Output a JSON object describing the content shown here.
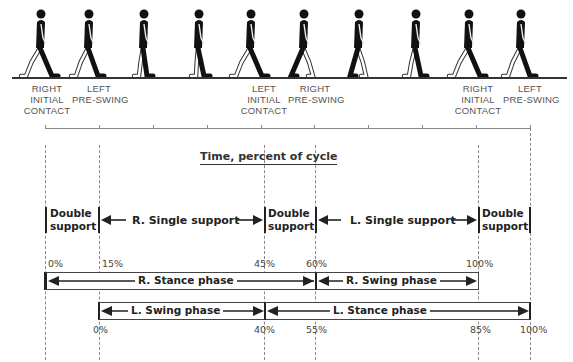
{
  "figures": {
    "count": 10,
    "description": "Walking human silhouettes depicting phases of gait cycle",
    "x_positions": [
      40,
      88,
      143,
      198,
      250,
      303,
      358,
      415,
      468,
      520
    ]
  },
  "event_labels": [
    {
      "text_lines": [
        "RIGHT",
        "INITIAL",
        "CONTACT"
      ],
      "x": 47
    },
    {
      "text_lines": [
        "LEFT",
        "PRE-SWING"
      ],
      "x": 99
    },
    {
      "text_lines": [
        "LEFT",
        "INITIAL",
        "CONTACT"
      ],
      "x": 264
    },
    {
      "text_lines": [
        "RIGHT",
        "PRE-SWING"
      ],
      "x": 315
    },
    {
      "text_lines": [
        "RIGHT",
        "INITIAL",
        "CONTACT"
      ],
      "x": 478
    },
    {
      "text_lines": [
        "LEFT",
        "PRE-SWING"
      ],
      "x": 530
    }
  ],
  "timeline": {
    "title": "Time, percent of cycle",
    "tick_count": 10
  },
  "support_phases": {
    "double_support_label_1": "Double",
    "double_support_label_2": "support",
    "r_single": "R. Single support",
    "l_single": "L. Single support"
  },
  "right_leg_percents": [
    "0%",
    "15%",
    "45%",
    "60%",
    "100%"
  ],
  "left_leg_percents": [
    "0%",
    "40%",
    "55%",
    "85%",
    "100%"
  ],
  "bars": {
    "r_stance": "R. Stance phase",
    "r_swing": "R. Swing phase",
    "l_swing": "L. Swing phase",
    "l_stance": "L. Stance phase"
  },
  "colors": {
    "ink": "#1a1a1a",
    "leading_leg": "#111111",
    "trailing_leg_outline": "#ffffff",
    "dashed_guides": "#888888"
  }
}
